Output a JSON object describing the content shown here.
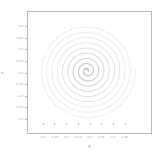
{
  "figure": {
    "background": "#ffffff",
    "frame_color": "#b9b9b9"
  },
  "axis": {
    "xlabel": "X",
    "ylabel": "Y"
  },
  "chart_data": {
    "type": "scatter",
    "title": "",
    "subtitle": "",
    "xlabel": "X",
    "ylabel": "Y",
    "grid": false,
    "legend": null,
    "legend_position": "none",
    "marker": "square",
    "marker_size": 1,
    "marker_color": "#c8c8c8",
    "xlim": [
      -0.8,
      0.8
    ],
    "ylim": [
      -0.8,
      0.8
    ],
    "xticks": [
      -0.6,
      -0.45,
      -0.3,
      -0.15,
      0.0,
      0.15,
      0.3,
      0.45
    ],
    "xticklabels": [
      "-0.6",
      "-0.45",
      "-0.3",
      "-0.15",
      "0.0",
      "0.15",
      "0.3",
      "0.45"
    ],
    "yticks": [
      0.6,
      0.45,
      0.3,
      0.15,
      0.0,
      -0.15,
      -0.3,
      -0.45,
      -0.6
    ],
    "yticklabels": [
      "0.6",
      "0.45",
      "0.3",
      "0.15",
      "0.0",
      "-0.15",
      "-0.3",
      "-0.45",
      "-0.6"
    ],
    "center": [
      -0.03,
      0.02
    ],
    "spiral": {
      "turns": 9,
      "points_total": 1000,
      "r_min": 0.012,
      "r_max": 0.63,
      "growth": "linear-in-theta"
    }
  }
}
